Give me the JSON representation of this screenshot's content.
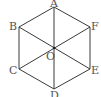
{
  "diagram": {
    "type": "regular-hexagon",
    "stroke_color": "#3a3a3a",
    "label_color": "#555555",
    "vertices": [
      {
        "name": "A",
        "x": 54,
        "y": 7,
        "lx": 50,
        "ly": 7
      },
      {
        "name": "B",
        "x": 19,
        "y": 27,
        "lx": 9,
        "ly": 27
      },
      {
        "name": "C",
        "x": 19,
        "y": 69,
        "lx": 9,
        "ly": 74
      },
      {
        "name": "D",
        "x": 54,
        "y": 89,
        "lx": 50,
        "ly": 99
      },
      {
        "name": "E",
        "x": 90,
        "y": 69,
        "lx": 91,
        "ly": 74
      },
      {
        "name": "F",
        "x": 90,
        "y": 27,
        "lx": 91,
        "ly": 28
      }
    ],
    "center": {
      "name": "O",
      "x": 54,
      "y": 48,
      "lx": 46,
      "ly": 60
    },
    "diagonals": [
      "AD",
      "BE",
      "CF"
    ],
    "labels": {
      "A": "A",
      "B": "B",
      "C": "C",
      "D": "D",
      "E": "E",
      "F": "F",
      "O": "O"
    }
  }
}
